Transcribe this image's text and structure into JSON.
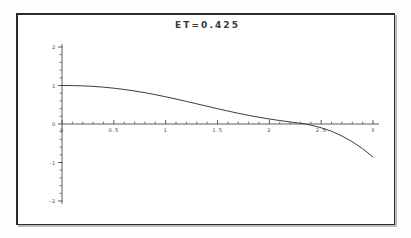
{
  "figure": {
    "title": "ET=0.425",
    "frame_color": "#2b2b2b",
    "background": "#ffffff",
    "curve_color": "#313131",
    "axis_color": "#4a4a4a"
  },
  "chart_data": {
    "type": "line",
    "title": "ET=0.425",
    "xlabel": "",
    "ylabel": "",
    "xlim": [
      0,
      3
    ],
    "ylim": [
      -2,
      2
    ],
    "grid": false,
    "legend": "none",
    "x_ticks": [
      0,
      0.5,
      1,
      1.5,
      2,
      2.5,
      3
    ],
    "x_tick_labels": [
      "0",
      "0.5",
      "1",
      "1.5",
      "2",
      "2.5",
      "3"
    ],
    "x_minor_tick_step": 0.1,
    "y_ticks": [
      -2,
      -1,
      0,
      1,
      2
    ],
    "y_tick_labels": [
      "-2",
      "-1",
      "0",
      "1",
      "2"
    ],
    "y_minor_tick_step": 0.2,
    "series": [
      {
        "name": "ET=0.425",
        "x": [
          0.0,
          0.1,
          0.2,
          0.3,
          0.4,
          0.5,
          0.6,
          0.7,
          0.8,
          0.9,
          1.0,
          1.1,
          1.2,
          1.3,
          1.4,
          1.5,
          1.6,
          1.7,
          1.8,
          1.9,
          2.0,
          2.1,
          2.2,
          2.3,
          2.35,
          2.4,
          2.5,
          2.6,
          2.7,
          2.8,
          2.9,
          3.0
        ],
        "y": [
          1.0,
          0.998,
          0.99,
          0.977,
          0.957,
          0.93,
          0.897,
          0.858,
          0.813,
          0.762,
          0.707,
          0.648,
          0.587,
          0.524,
          0.461,
          0.398,
          0.337,
          0.279,
          0.225,
          0.175,
          0.13,
          0.09,
          0.053,
          0.018,
          0.0,
          -0.03,
          -0.098,
          -0.19,
          -0.31,
          -0.46,
          -0.64,
          -0.86
        ]
      }
    ]
  }
}
